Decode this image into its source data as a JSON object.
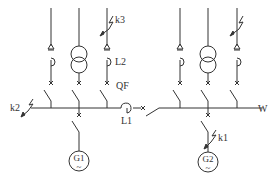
{
  "diagram": {
    "type": "electrical single-line diagram",
    "line_color": "#333333",
    "busbar_label": "W",
    "labels": {
      "k1": "k1",
      "k2": "k2",
      "k3": "k3",
      "L1": "L1",
      "L2": "L2",
      "QF": "QF",
      "W": "W"
    },
    "generators": [
      {
        "id": "G1",
        "label": "G1",
        "symbol": "~"
      },
      {
        "id": "G2",
        "label": "G2",
        "symbol": "~"
      }
    ],
    "feeders_left": [
      {
        "type": "reactor-feeder"
      },
      {
        "type": "transformer"
      },
      {
        "type": "reactor-feeder",
        "fault": "k3",
        "reactor": "L2",
        "breaker": "QF"
      }
    ],
    "feeders_right": [
      {
        "type": "reactor-feeder"
      },
      {
        "type": "transformer"
      },
      {
        "type": "reactor-feeder",
        "fault": "lightning"
      }
    ],
    "bus_section": {
      "reactor": "L1"
    }
  }
}
